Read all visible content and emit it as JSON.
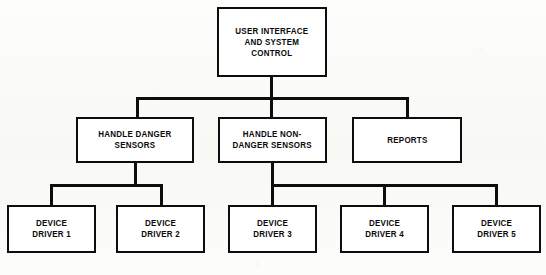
{
  "diagram": {
    "type": "hierarchy-chart",
    "orientation": "top-down",
    "background_color": "#fbfbf9",
    "line_color": "#0d0d0d",
    "box_fill_color": "#ffffff",
    "levels": 3,
    "nodes": [
      {
        "id": "root",
        "label": "USER INTERFACE\nAND SYSTEM\nCONTROL",
        "level": 0,
        "x": 217,
        "y": 7,
        "w": 110,
        "h": 70
      },
      {
        "id": "handle-danger-sensors",
        "label": "HANDLE DANGER\nSENSORS",
        "level": 1,
        "x": 76,
        "y": 117,
        "w": 118,
        "h": 46
      },
      {
        "id": "handle-non-danger-sensors",
        "label": "HANDLE NON-\nDANGER SENSORS",
        "level": 1,
        "x": 218,
        "y": 117,
        "w": 109,
        "h": 46
      },
      {
        "id": "reports",
        "label": "REPORTS",
        "level": 1,
        "x": 352,
        "y": 117,
        "w": 110,
        "h": 46
      },
      {
        "id": "device-driver-1",
        "label": "DEVICE\nDRIVER 1",
        "level": 2,
        "x": 7,
        "y": 205,
        "w": 89,
        "h": 48
      },
      {
        "id": "device-driver-2",
        "label": "DEVICE\nDRIVER 2",
        "level": 2,
        "x": 116,
        "y": 205,
        "w": 89,
        "h": 48
      },
      {
        "id": "device-driver-3",
        "label": "DEVICE\nDRIVER 3",
        "level": 2,
        "x": 228,
        "y": 205,
        "w": 89,
        "h": 48
      },
      {
        "id": "device-driver-4",
        "label": "DEVICE\nDRIVER 4",
        "level": 2,
        "x": 340,
        "y": 205,
        "w": 89,
        "h": 48
      },
      {
        "id": "device-driver-5",
        "label": "DEVICE\nDRIVER 5",
        "level": 2,
        "x": 452,
        "y": 205,
        "w": 89,
        "h": 48
      }
    ],
    "edges": [
      {
        "from": "root",
        "to": "handle-danger-sensors"
      },
      {
        "from": "root",
        "to": "handle-non-danger-sensors"
      },
      {
        "from": "root",
        "to": "reports"
      },
      {
        "from": "handle-danger-sensors",
        "to": "device-driver-1"
      },
      {
        "from": "handle-danger-sensors",
        "to": "device-driver-2"
      },
      {
        "from": "handle-non-danger-sensors",
        "to": "device-driver-3"
      },
      {
        "from": "handle-non-danger-sensors",
        "to": "device-driver-4"
      },
      {
        "from": "handle-non-danger-sensors",
        "to": "device-driver-5"
      }
    ],
    "connectors": [
      {
        "id": "root-stem",
        "orient": "v",
        "x": 270,
        "y": 77,
        "len": 22
      },
      {
        "id": "root-bus",
        "orient": "h",
        "x": 136,
        "y": 97,
        "len": 272
      },
      {
        "id": "bus-to-danger",
        "orient": "v",
        "x": 136,
        "y": 97,
        "len": 20
      },
      {
        "id": "bus-to-non-danger",
        "orient": "v",
        "x": 270,
        "y": 97,
        "len": 20
      },
      {
        "id": "bus-to-reports",
        "orient": "v",
        "x": 406,
        "y": 97,
        "len": 20
      },
      {
        "id": "danger-stem",
        "orient": "v",
        "x": 134,
        "y": 163,
        "len": 23
      },
      {
        "id": "danger-bus",
        "orient": "h",
        "x": 50,
        "y": 184,
        "len": 112
      },
      {
        "id": "bus-to-driver-1",
        "orient": "v",
        "x": 50,
        "y": 184,
        "len": 21
      },
      {
        "id": "bus-to-driver-2",
        "orient": "v",
        "x": 160,
        "y": 184,
        "len": 21
      },
      {
        "id": "non-danger-stem",
        "orient": "v",
        "x": 271,
        "y": 163,
        "len": 23
      },
      {
        "id": "non-danger-bus",
        "orient": "h",
        "x": 271,
        "y": 184,
        "len": 225
      },
      {
        "id": "bus-to-driver-3",
        "orient": "v",
        "x": 271,
        "y": 184,
        "len": 21
      },
      {
        "id": "bus-to-driver-4",
        "orient": "v",
        "x": 383,
        "y": 184,
        "len": 21
      },
      {
        "id": "bus-to-driver-5",
        "orient": "v",
        "x": 495,
        "y": 184,
        "len": 21
      }
    ]
  }
}
